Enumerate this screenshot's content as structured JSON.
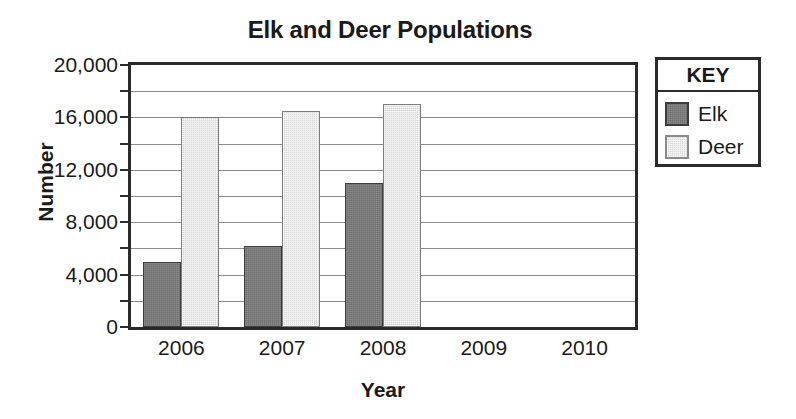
{
  "chart_data": {
    "type": "bar",
    "title": "Elk and Deer Populations",
    "xlabel": "Year",
    "ylabel": "Number",
    "categories": [
      "2006",
      "2007",
      "2008",
      "2009",
      "2010"
    ],
    "series": [
      {
        "name": "Elk",
        "color": "#6e6e6e",
        "values": [
          5000,
          6200,
          11000,
          null,
          null
        ]
      },
      {
        "name": "Deer",
        "color": "#d6d6d6",
        "values": [
          16000,
          16500,
          17000,
          null,
          null
        ]
      }
    ],
    "ylim": [
      0,
      20000
    ],
    "ytick_labels": [
      "20,000",
      "16,000",
      "12,000",
      "8,000",
      "4,000",
      "0"
    ],
    "ytick_values": [
      20000,
      16000,
      12000,
      8000,
      4000,
      0
    ],
    "gridline_values": [
      18000,
      16000,
      14000,
      12000,
      10000,
      8000,
      6000,
      4000,
      2000
    ],
    "grid": true,
    "legend_position": "right",
    "legend_title": "KEY"
  }
}
